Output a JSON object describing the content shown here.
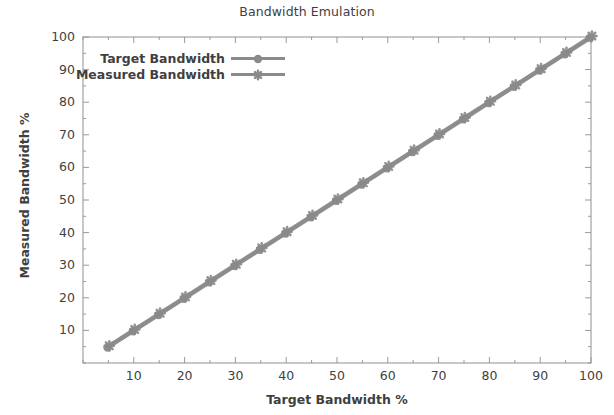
{
  "chart_data": {
    "type": "line",
    "title": "Bandwidth Emulation",
    "xlabel": "Target Bandwidth %",
    "ylabel": "Measured Bandwidth %",
    "xlim": [
      0,
      100
    ],
    "ylim": [
      0,
      100
    ],
    "grid": false,
    "legend_position": "upper left inside",
    "xticks": [
      10,
      20,
      30,
      40,
      50,
      60,
      70,
      80,
      90,
      100
    ],
    "yticks": [
      10,
      20,
      30,
      40,
      50,
      60,
      70,
      80,
      90,
      100
    ],
    "xtick_labels": [
      "10",
      "20",
      "30",
      "40",
      "50",
      "60",
      "70",
      "80",
      "90",
      "100"
    ],
    "ytick_labels": [
      "10",
      "20",
      "30",
      "40",
      "50",
      "60",
      "70",
      "80",
      "90",
      "100"
    ],
    "minor_tick_interval": 5,
    "x": [
      5,
      10,
      15,
      20,
      25,
      30,
      35,
      40,
      45,
      50,
      55,
      60,
      65,
      70,
      75,
      80,
      85,
      90,
      95,
      100
    ],
    "series": [
      {
        "name": "Target Bandwidth",
        "marker": "circle",
        "color": "#8a8a8a",
        "values": [
          5,
          10,
          15,
          20,
          25,
          30,
          35,
          40,
          45,
          50,
          55,
          60,
          65,
          70,
          75,
          80,
          85,
          90,
          95,
          100
        ]
      },
      {
        "name": "Measured Bandwidth",
        "marker": "star",
        "color": "#8a8a8a",
        "values": [
          5,
          10,
          15,
          20,
          25,
          30,
          35,
          40,
          45,
          50,
          55,
          60,
          65,
          70,
          75,
          80,
          85,
          90,
          95,
          100
        ]
      }
    ],
    "colors": {
      "line": "#8a8a8a",
      "marker": "#8a8a8a",
      "axis": "#9a9a9a",
      "text": "#3f3f3f",
      "background": "#ffffff"
    }
  },
  "legend": {
    "items": [
      {
        "label": "Target Bandwidth"
      },
      {
        "label": "Measured Bandwidth"
      }
    ]
  }
}
